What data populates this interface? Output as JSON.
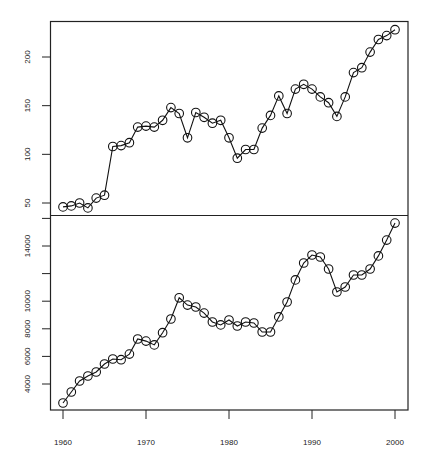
{
  "chart_data": [
    {
      "type": "line",
      "panel": "top",
      "title": "",
      "xlabel": "",
      "ylabel": "",
      "marker": "open-circle",
      "x": [
        1960,
        1961,
        1962,
        1963,
        1964,
        1965,
        1966,
        1967,
        1968,
        1969,
        1970,
        1971,
        1972,
        1973,
        1974,
        1975,
        1976,
        1977,
        1978,
        1979,
        1980,
        1981,
        1982,
        1983,
        1984,
        1985,
        1986,
        1987,
        1988,
        1989,
        1990,
        1991,
        1992,
        1993,
        1994,
        1995,
        1996,
        1997,
        1998,
        1999,
        2000
      ],
      "values": [
        46,
        47,
        50,
        45,
        55,
        58,
        108,
        109,
        112,
        128,
        129,
        128,
        135,
        148,
        142,
        117,
        143,
        138,
        132,
        135,
        117,
        96,
        105,
        105,
        127,
        140,
        160,
        142,
        167,
        172,
        167,
        159,
        153,
        139,
        159,
        184,
        189,
        205,
        218,
        222,
        228
      ],
      "yticks": [
        50,
        100,
        150,
        200
      ],
      "ytick_labels": [
        "50",
        "100",
        "150",
        "200"
      ],
      "ylim": [
        38,
        235
      ],
      "grid": false
    },
    {
      "type": "line",
      "panel": "bottom",
      "title": "",
      "xlabel": "",
      "ylabel": "",
      "marker": "open-circle",
      "x": [
        1960,
        1961,
        1962,
        1963,
        1964,
        1965,
        1966,
        1967,
        1968,
        1969,
        1970,
        1971,
        1972,
        1973,
        1974,
        1975,
        1976,
        1977,
        1978,
        1979,
        1980,
        1981,
        1982,
        1983,
        1984,
        1985,
        1986,
        1987,
        1988,
        1989,
        1990,
        1991,
        1992,
        1993,
        1994,
        1995,
        1996,
        1997,
        1998,
        1999,
        2000
      ],
      "values": [
        2620,
        3420,
        4220,
        4580,
        4870,
        5450,
        5810,
        5760,
        6170,
        7260,
        7110,
        6830,
        7720,
        8710,
        10250,
        9720,
        9580,
        9140,
        8490,
        8280,
        8640,
        8200,
        8490,
        8420,
        7770,
        7770,
        8860,
        9940,
        11540,
        12770,
        13350,
        13200,
        12330,
        10670,
        11030,
        11900,
        11900,
        12330,
        13280,
        14430,
        15660
      ],
      "yticks": [
        4000,
        6000,
        8000,
        10000,
        12000,
        14000,
        16000
      ],
      "ytick_labels": [
        "4000",
        "6000",
        "8000",
        "10000",
        "",
        "14000",
        ""
      ],
      "ylim": [
        2100,
        16100
      ],
      "grid": false
    }
  ],
  "x_axis": {
    "ticks": [
      1960,
      1970,
      1980,
      1990,
      2000
    ],
    "tick_labels": [
      "1960",
      "1970",
      "1980",
      "1990",
      "2000"
    ]
  }
}
